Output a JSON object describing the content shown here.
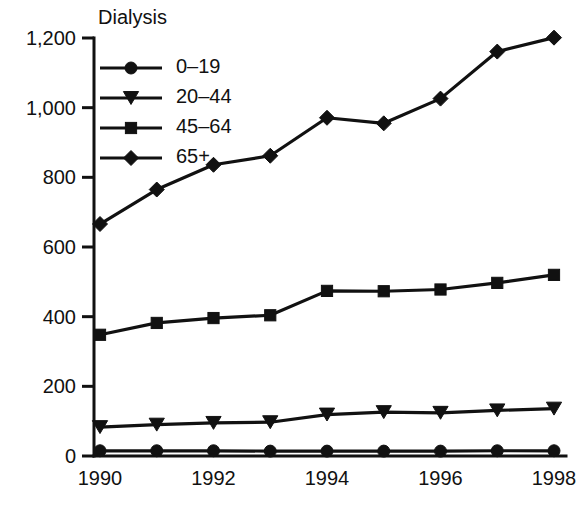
{
  "chart_data": {
    "type": "line",
    "title": "Dialysis",
    "xlabel": "",
    "ylabel": "",
    "x": [
      1990,
      1991,
      1992,
      1993,
      1994,
      1995,
      1996,
      1997,
      1998
    ],
    "x_tick_labels": [
      "1990",
      "",
      "1992",
      "",
      "1994",
      "",
      "1996",
      "",
      "1998"
    ],
    "y_tick_labels": [
      "0",
      "200",
      "400",
      "600",
      "800",
      "1,000",
      "1,200"
    ],
    "y_ticks": [
      0,
      200,
      400,
      600,
      800,
      1000,
      1200
    ],
    "ylim": [
      0,
      1200
    ],
    "xlim": [
      1990,
      1998
    ],
    "grid": false,
    "legend_position": "upper-left-inside",
    "series": [
      {
        "name": "0–19",
        "marker": "circle",
        "values": [
          15,
          15,
          15,
          14,
          14,
          14,
          14,
          15,
          15
        ]
      },
      {
        "name": "20–44",
        "marker": "triangle-down",
        "values": [
          83,
          90,
          95,
          97,
          119,
          126,
          124,
          131,
          136
        ]
      },
      {
        "name": "45–64",
        "marker": "square",
        "values": [
          348,
          382,
          396,
          404,
          474,
          473,
          478,
          497,
          520
        ]
      },
      {
        "name": "65+",
        "marker": "diamond",
        "values": [
          666,
          765,
          836,
          862,
          971,
          955,
          1026,
          1161,
          1201
        ]
      }
    ]
  }
}
